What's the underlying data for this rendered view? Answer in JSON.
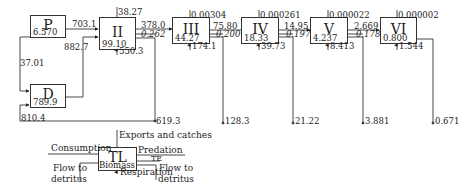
{
  "diagram": {
    "type": "lindeman-spine trophic flow diagram",
    "compartments": [
      {
        "id": "P",
        "name": "P",
        "biomass": "6.570"
      },
      {
        "id": "D",
        "name": "D",
        "biomass": "789.9"
      },
      {
        "id": "II",
        "name": "II",
        "biomass": "99.10",
        "exports": "38.27",
        "respiration": "550.3"
      },
      {
        "id": "III",
        "name": "III",
        "biomass": "44.27",
        "exports": "0.00304",
        "respiration": "174.1"
      },
      {
        "id": "IV",
        "name": "IV",
        "biomass": "18.33",
        "exports": "0.000261",
        "respiration": "39.73"
      },
      {
        "id": "V",
        "name": "V",
        "biomass": "4.237",
        "exports": "0.000022",
        "respiration": "8.413"
      },
      {
        "id": "VI",
        "name": "VI",
        "biomass": "0.800",
        "exports": "0.000002",
        "respiration": "1.544"
      }
    ],
    "flows": {
      "P_to_II": "703.1",
      "D_to_II": "882.7",
      "P_to_D": "37.01",
      "to_D_total": "810.4",
      "II_to_III": {
        "predation": "378.0",
        "te": "0.262"
      },
      "III_to_IV": {
        "predation": "75.80",
        "te": "0.200"
      },
      "IV_to_V": {
        "predation": "14.95",
        "te": "0.197"
      },
      "V_to_VI": {
        "predation": "2.669",
        "te": "0.178"
      },
      "detritus": [
        "619.3",
        "128.3",
        "21.22",
        "3.881",
        "0.671"
      ]
    },
    "legend": {
      "box_name": "TL",
      "biomass": "Biomass",
      "exports": "Exports and catches",
      "consumption": "Consumption",
      "predation": "Predation",
      "te": "TE",
      "respiration": "Respiration",
      "flow_to_detritus_left": "Flow to detritus",
      "flow_to_detritus_left_1": "Flow to",
      "flow_to_detritus_left_2": "detritus",
      "flow_to_detritus_right_1": "Flow to",
      "flow_to_detritus_right_2": "detritus"
    }
  }
}
